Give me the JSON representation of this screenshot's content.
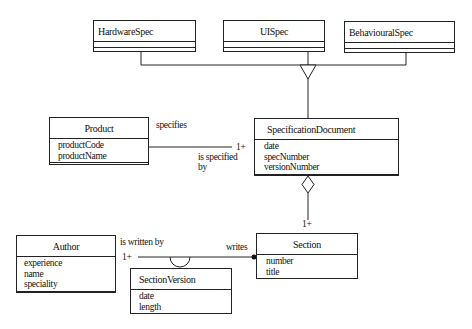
{
  "diagram": {
    "type": "UML class diagram",
    "classes": {
      "hardware_spec": {
        "name": "HardwareSpec",
        "attributes": []
      },
      "ui_spec": {
        "name": "UISpec",
        "attributes": []
      },
      "behavioural_spec": {
        "name": "BehaviouralSpec",
        "attributes": []
      },
      "product": {
        "name": "Product",
        "attributes": [
          "productCode",
          "productName"
        ]
      },
      "specification_document": {
        "name": "SpecificationDocument",
        "attributes": [
          "date",
          "specNumber",
          "versionNumber"
        ]
      },
      "section": {
        "name": "Section",
        "attributes": [
          "number",
          "title"
        ]
      },
      "author": {
        "name": "Author",
        "attributes": [
          "experience",
          "name",
          "speciality"
        ]
      },
      "section_version": {
        "name": "SectionVersion",
        "attributes": [
          "date",
          "length"
        ]
      }
    },
    "relationships": {
      "generalization": {
        "parent": "SpecificationDocument",
        "children": [
          "HardwareSpec",
          "UISpec",
          "BehaviouralSpec"
        ]
      },
      "product_spec": {
        "label_top": "specifies",
        "label_bottom_1": "is specified",
        "label_bottom_2": "by",
        "multiplicity": "1+"
      },
      "spec_section": {
        "kind": "aggregation",
        "multiplicity": "1+"
      },
      "author_section": {
        "label_author": "is written by",
        "label_section": "writes",
        "multiplicity": "1+",
        "association_class": "SectionVersion"
      }
    }
  }
}
